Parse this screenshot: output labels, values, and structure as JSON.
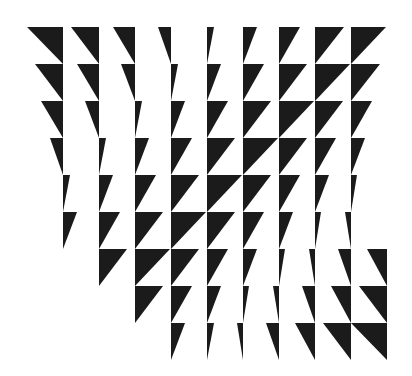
{
  "artwork": {
    "background": "#ffffff",
    "fill": "#1b1b1b",
    "grid": {
      "origin_x": 63,
      "origin_y": 27,
      "col_spacing": 36,
      "row_height": 37
    },
    "rows": [
      {
        "row": 0,
        "cells": [
          {
            "c": 0,
            "w": -36
          },
          {
            "c": 1,
            "w": -28
          },
          {
            "c": 2,
            "w": -22
          },
          {
            "c": 3,
            "w": -13
          },
          {
            "c": 4,
            "w": 7
          },
          {
            "c": 5,
            "w": 14
          },
          {
            "c": 6,
            "w": 21
          },
          {
            "c": 7,
            "w": 29
          },
          {
            "c": 8,
            "w": 35
          }
        ]
      },
      {
        "row": 1,
        "cells": [
          {
            "c": 0,
            "w": -28
          },
          {
            "c": 1,
            "w": -22
          },
          {
            "c": 2,
            "w": -14
          },
          {
            "c": 3,
            "w": 7
          },
          {
            "c": 4,
            "w": 14
          },
          {
            "c": 5,
            "w": 21
          },
          {
            "c": 6,
            "w": 28
          },
          {
            "c": 7,
            "w": 35
          },
          {
            "c": 8,
            "w": 29
          }
        ]
      },
      {
        "row": 2,
        "cells": [
          {
            "c": 0,
            "w": -22
          },
          {
            "c": 1,
            "w": -14
          },
          {
            "c": 2,
            "w": 7
          },
          {
            "c": 3,
            "w": 14
          },
          {
            "c": 4,
            "w": 21
          },
          {
            "c": 5,
            "w": 28
          },
          {
            "c": 6,
            "w": 35
          },
          {
            "c": 7,
            "w": 28
          },
          {
            "c": 8,
            "w": 21
          }
        ]
      },
      {
        "row": 3,
        "cells": [
          {
            "c": 0,
            "w": -13
          },
          {
            "c": 1,
            "w": 7
          },
          {
            "c": 2,
            "w": 14
          },
          {
            "c": 3,
            "w": 21
          },
          {
            "c": 4,
            "w": 28
          },
          {
            "c": 5,
            "w": 35
          },
          {
            "c": 6,
            "w": 28
          },
          {
            "c": 7,
            "w": 21
          },
          {
            "c": 8,
            "w": 14
          }
        ]
      },
      {
        "row": 4,
        "cells": [
          {
            "c": 0,
            "w": 7
          },
          {
            "c": 1,
            "w": 14
          },
          {
            "c": 2,
            "w": 21
          },
          {
            "c": 3,
            "w": 28
          },
          {
            "c": 4,
            "w": 35
          },
          {
            "c": 5,
            "w": 28
          },
          {
            "c": 6,
            "w": 21
          },
          {
            "c": 7,
            "w": 14
          },
          {
            "c": 8,
            "w": 6
          }
        ]
      },
      {
        "row": 5,
        "cells": [
          {
            "c": 0,
            "w": 14
          },
          {
            "c": 1,
            "w": 21
          },
          {
            "c": 2,
            "w": 28
          },
          {
            "c": 3,
            "w": 35
          },
          {
            "c": 4,
            "w": 28
          },
          {
            "c": 5,
            "w": 21
          },
          {
            "c": 6,
            "w": 14
          },
          {
            "c": 7,
            "w": 6
          },
          {
            "c": 8,
            "w": -6
          }
        ]
      },
      {
        "row": 6,
        "cells": [
          {
            "c": 1,
            "w": 28
          },
          {
            "c": 2,
            "w": 35
          },
          {
            "c": 3,
            "w": 28
          },
          {
            "c": 4,
            "w": 21
          },
          {
            "c": 5,
            "w": 14
          },
          {
            "c": 6,
            "w": 6
          },
          {
            "c": 7,
            "w": -6
          },
          {
            "c": 8,
            "w": -13
          },
          {
            "c": 9,
            "w": -20
          }
        ]
      },
      {
        "row": 7,
        "cells": [
          {
            "c": 2,
            "w": 28
          },
          {
            "c": 3,
            "w": 21
          },
          {
            "c": 4,
            "w": 14
          },
          {
            "c": 5,
            "w": 6
          },
          {
            "c": 6,
            "w": -6
          },
          {
            "c": 7,
            "w": -13
          },
          {
            "c": 8,
            "w": -20
          },
          {
            "c": 9,
            "w": -28
          }
        ]
      },
      {
        "row": 8,
        "cells": [
          {
            "c": 3,
            "w": 14
          },
          {
            "c": 4,
            "w": 7
          },
          {
            "c": 5,
            "w": -6
          },
          {
            "c": 6,
            "w": -13
          },
          {
            "c": 7,
            "w": -20
          },
          {
            "c": 8,
            "w": -28
          },
          {
            "c": 9,
            "w": -36
          }
        ]
      }
    ]
  }
}
